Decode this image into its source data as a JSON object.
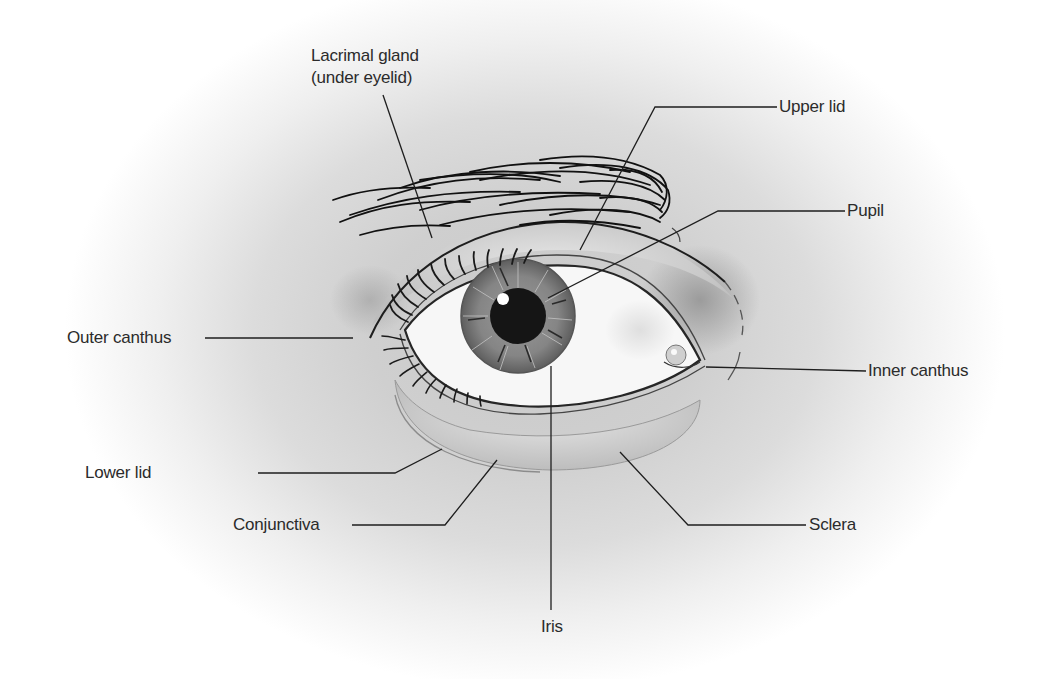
{
  "diagram": {
    "colors": {
      "background_center": "#c9c9c9",
      "background_edge": "#ffffff",
      "line": "#1e1e1e",
      "label_text": "#2b2b2b",
      "iris": "#7d7d7d",
      "pupil": "#151515",
      "sclera": "#f7f7f7"
    },
    "labels": {
      "lacrimal_gland_line1": "Lacrimal gland",
      "lacrimal_gland_line2": "(under eyelid)",
      "upper_lid": "Upper lid",
      "pupil": "Pupil",
      "outer_canthus": "Outer canthus",
      "inner_canthus": "Inner canthus",
      "lower_lid": "Lower lid",
      "conjunctiva": "Conjunctiva",
      "sclera": "Sclera",
      "iris": "Iris"
    }
  }
}
